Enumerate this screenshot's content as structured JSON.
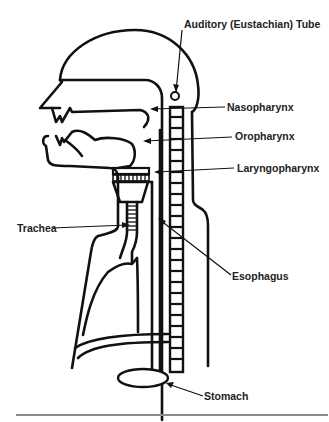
{
  "figure": {
    "labels": {
      "auditory_tube": "Auditory (Eustachian) Tube",
      "nasopharynx": "Nasopharynx",
      "oropharynx": "Oropharynx",
      "laryngopharynx": "Laryngopharynx",
      "trachea": "Trachea",
      "esophagus": "Esophagus",
      "stomach": "Stomach"
    },
    "colors": {
      "line": "#111111",
      "text": "#222222",
      "rule": "#8a8a8a",
      "background": "#ffffff"
    }
  }
}
